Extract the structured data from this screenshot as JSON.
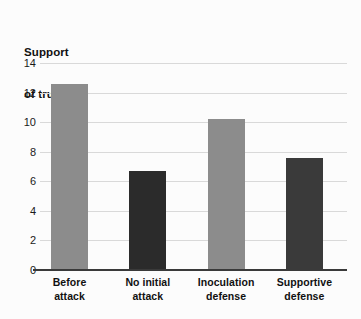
{
  "chart_data": {
    "type": "bar",
    "title": "Support of truism",
    "title_lines": [
      "Support",
      "of truism"
    ],
    "xlabel": "",
    "ylabel": "Support of truism",
    "categories": [
      "Before attack",
      "No initial attack",
      "Inoculation defense",
      "Supportive defense"
    ],
    "category_lines": [
      [
        "Before",
        "attack"
      ],
      [
        "No initial",
        "attack"
      ],
      [
        "Inoculation",
        "defense"
      ],
      [
        "Supportive",
        "defense"
      ]
    ],
    "values": [
      12.6,
      6.7,
      10.2,
      7.6
    ],
    "bar_colors": [
      "#8c8c8c",
      "#2b2b2b",
      "#8c8c8c",
      "#3a3a3a"
    ],
    "ylim": [
      0,
      14
    ],
    "yticks": [
      0,
      2,
      4,
      6,
      8,
      10,
      12,
      14
    ],
    "ytick_labels": [
      "0",
      "2",
      "4",
      "6",
      "8",
      "10",
      "12",
      "14"
    ],
    "grid": true,
    "grid_color": "#d9d9d9",
    "legend": null,
    "background_color": "#fcfcfc",
    "axis_color": "#3a3a3a"
  }
}
